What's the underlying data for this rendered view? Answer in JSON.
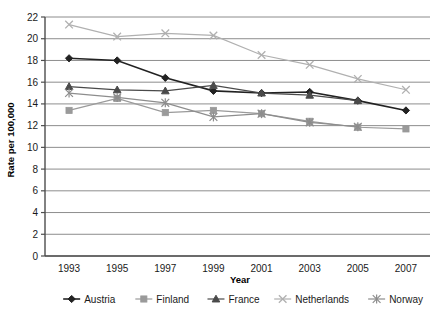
{
  "chart_data": {
    "type": "line",
    "title": "",
    "xlabel": "Year",
    "ylabel": "Rate per 100,000",
    "x": [
      1993,
      1995,
      1997,
      1999,
      2001,
      2003,
      2005,
      2007
    ],
    "categories": [
      "1993",
      "1995",
      "1997",
      "1999",
      "2001",
      "2003",
      "2005",
      "2007"
    ],
    "xlim": [
      1992,
      2008
    ],
    "ylim": [
      0,
      22
    ],
    "yticks": [
      0,
      2,
      4,
      6,
      8,
      10,
      12,
      14,
      16,
      18,
      20,
      22
    ],
    "ytick_labels": [
      "0",
      "2",
      "4",
      "6",
      "8",
      "10",
      "12",
      "14",
      "16",
      "18",
      "20",
      "22"
    ],
    "grid": "horizontal",
    "legend_position": "bottom",
    "series": [
      {
        "name": "Austria",
        "marker": "diamond",
        "color": "#222222",
        "values": [
          18.2,
          18.0,
          16.4,
          15.2,
          15.0,
          15.1,
          14.3,
          13.4
        ]
      },
      {
        "name": "Finland",
        "marker": "square",
        "color": "#9a9a9a",
        "values": [
          13.4,
          14.5,
          13.2,
          13.4,
          13.1,
          12.4,
          11.85,
          11.7
        ]
      },
      {
        "name": "France",
        "marker": "triangle",
        "color": "#4a4a4a",
        "values": [
          15.6,
          15.3,
          15.2,
          15.7,
          15.0,
          14.8,
          14.3,
          null
        ]
      },
      {
        "name": "Netherlands",
        "marker": "cross",
        "color": "#b0b0b0",
        "values": [
          21.3,
          20.2,
          20.5,
          20.3,
          18.5,
          17.6,
          16.3,
          15.3
        ]
      },
      {
        "name": "Norway",
        "marker": "asterisk",
        "color": "#8d8d8d",
        "values": [
          15.0,
          14.6,
          14.1,
          12.8,
          13.1,
          12.3,
          11.9,
          null
        ]
      }
    ]
  },
  "legend": {
    "items": [
      {
        "label": "Austria"
      },
      {
        "label": "Finland"
      },
      {
        "label": "France"
      },
      {
        "label": "Netherlands"
      },
      {
        "label": "Norway"
      }
    ]
  }
}
